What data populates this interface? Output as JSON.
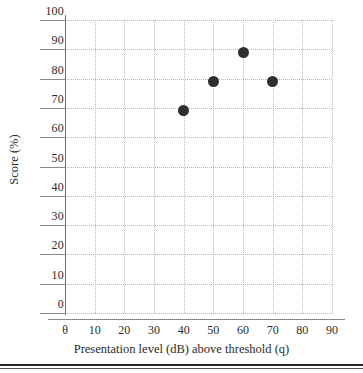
{
  "chart_data": {
    "type": "scatter",
    "title": "",
    "xlabel": "Presentation level (dB) above threshold (q)",
    "ylabel": "Score (%)",
    "xlim": [
      0,
      90
    ],
    "ylim": [
      0,
      100
    ],
    "grid": true,
    "legend": null,
    "x_tick_labels": [
      "θ",
      "10",
      "20",
      "30",
      "40",
      "50",
      "60",
      "70",
      "80",
      "90"
    ],
    "x_tick_values": [
      0,
      10,
      20,
      30,
      40,
      50,
      60,
      70,
      80,
      90
    ],
    "y_tick_labels": [
      "0",
      "10",
      "20",
      "30",
      "40",
      "50",
      "60",
      "70",
      "80",
      "90",
      "100"
    ],
    "y_tick_values": [
      0,
      10,
      20,
      30,
      40,
      50,
      60,
      70,
      80,
      90,
      100
    ],
    "marker_color": "#2f2f2f",
    "gridline_color": "#b8b8b8",
    "axis_color": "#8a8a8a",
    "points": [
      {
        "x": 40,
        "y": 69
      },
      {
        "x": 50,
        "y": 79
      },
      {
        "x": 60,
        "y": 89
      },
      {
        "x": 70,
        "y": 79
      }
    ]
  }
}
